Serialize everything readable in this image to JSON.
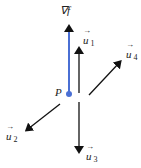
{
  "diagram": {
    "point_label": "P",
    "gradient_label": "∇f",
    "vectors": [
      {
        "name": "u",
        "subscript": "1"
      },
      {
        "name": "u",
        "subscript": "2"
      },
      {
        "name": "u",
        "subscript": "3"
      },
      {
        "name": "u",
        "subscript": "4"
      }
    ],
    "colors": {
      "gradient": "#4a6fd4",
      "vectors": "#111111"
    }
  }
}
